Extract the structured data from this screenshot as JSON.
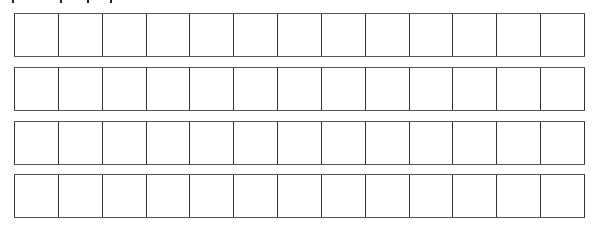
{
  "grid": {
    "rows": 4,
    "columns": 13,
    "cells": [
      [
        "",
        "",
        "",
        "",
        "",
        "",
        "",
        "",
        "",
        "",
        "",
        "",
        ""
      ],
      [
        "",
        "",
        "",
        "",
        "",
        "",
        "",
        "",
        "",
        "",
        "",
        "",
        ""
      ],
      [
        "",
        "",
        "",
        "",
        "",
        "",
        "",
        "",
        "",
        "",
        "",
        "",
        ""
      ],
      [
        "",
        "",
        "",
        "",
        "",
        "",
        "",
        "",
        "",
        "",
        "",
        "",
        ""
      ]
    ],
    "border_color": "#333333",
    "background_color": "#ffffff"
  }
}
